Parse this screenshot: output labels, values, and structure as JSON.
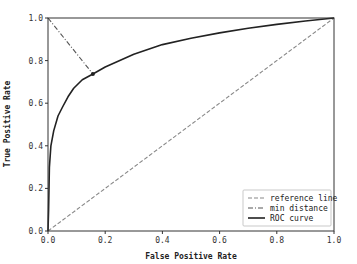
{
  "chart_data": {
    "type": "line",
    "title": "",
    "xlabel": "False Positive Rate",
    "ylabel": "True Positive Rate",
    "xlim": [
      0.0,
      1.0
    ],
    "ylim": [
      0.0,
      1.0
    ],
    "xticks": [
      "0.0",
      "0.2",
      "0.4",
      "0.6",
      "0.8",
      "1.0"
    ],
    "yticks": [
      "0.0",
      "0.2",
      "0.4",
      "0.6",
      "0.8",
      "1.0"
    ],
    "grid": false,
    "legend_position": "lower right",
    "series": [
      {
        "name": "reference line",
        "style": "dashed",
        "color": "#888888",
        "x": [
          0.0,
          1.0
        ],
        "y": [
          0.0,
          1.0
        ]
      },
      {
        "name": "min distance",
        "style": "dashdot",
        "color": "#555555",
        "x": [
          0.0,
          0.157
        ],
        "y": [
          1.0,
          0.737
        ]
      },
      {
        "name": "ROC curve",
        "style": "solid",
        "color": "#222222",
        "x": [
          0.0,
          0.002,
          0.005,
          0.01,
          0.02,
          0.035,
          0.05,
          0.07,
          0.09,
          0.12,
          0.157,
          0.2,
          0.3,
          0.4,
          0.5,
          0.6,
          0.7,
          0.8,
          0.9,
          1.0
        ],
        "y": [
          0.0,
          0.1,
          0.3,
          0.4,
          0.47,
          0.54,
          0.58,
          0.63,
          0.67,
          0.71,
          0.737,
          0.77,
          0.83,
          0.875,
          0.905,
          0.93,
          0.952,
          0.97,
          0.986,
          1.0
        ]
      }
    ],
    "annotations": [
      {
        "type": "marker",
        "label": "optimal point",
        "x": 0.157,
        "y": 0.737
      }
    ]
  },
  "legend": {
    "items": [
      {
        "label": "reference line",
        "style": "dashed"
      },
      {
        "label": "min distance",
        "style": "dashdot"
      },
      {
        "label": "ROC curve",
        "style": "solid"
      }
    ]
  }
}
